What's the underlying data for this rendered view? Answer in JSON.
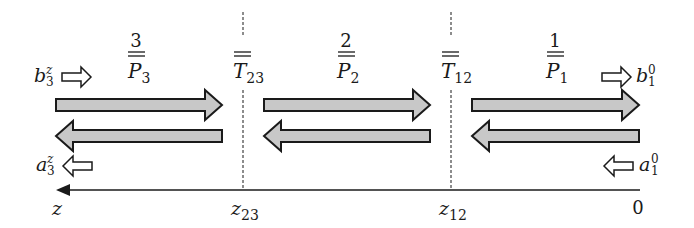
{
  "diagram": {
    "sections": [
      {
        "index_label": "3",
        "matrix": "P",
        "subscript": "3"
      },
      {
        "index_label": "2",
        "matrix": "P",
        "subscript": "2"
      },
      {
        "index_label": "1",
        "matrix": "P",
        "subscript": "1"
      }
    ],
    "interfaces": [
      {
        "matrix": "T",
        "subscript": "23",
        "axis_label": "z",
        "axis_subscript": "23"
      },
      {
        "matrix": "T",
        "subscript": "12",
        "axis_label": "z",
        "axis_subscript": "12"
      }
    ],
    "waves": {
      "b_left": {
        "base": "b",
        "sub": "3",
        "sup": "z"
      },
      "a_left": {
        "base": "a",
        "sub": "3",
        "sup": "z"
      },
      "b_right": {
        "base": "b",
        "sub": "1",
        "sup": "0"
      },
      "a_right": {
        "base": "a",
        "sub": "1",
        "sup": "0"
      }
    },
    "axis": {
      "left_label": "z",
      "right_label": "0"
    },
    "colors": {
      "arrow_fill": "#c8c8c8",
      "stroke": "#1a1a1a"
    }
  }
}
